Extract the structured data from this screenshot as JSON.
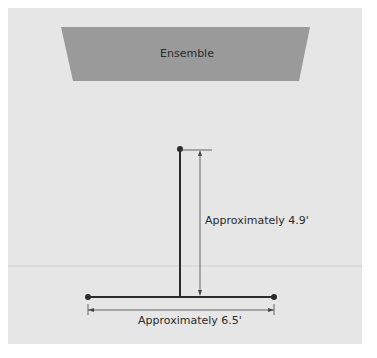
{
  "diagram": {
    "stage_label": "Ensemble",
    "vertical_dimension": "Approximately 4.9'",
    "horizontal_dimension": "Approximately 6.5'",
    "colors": {
      "background": "#e6e6e6",
      "stage": "#9a9a9a",
      "stand": "#2b2b2b",
      "dimension_line": "#444444",
      "guide_line": "#cfcfcf"
    }
  }
}
